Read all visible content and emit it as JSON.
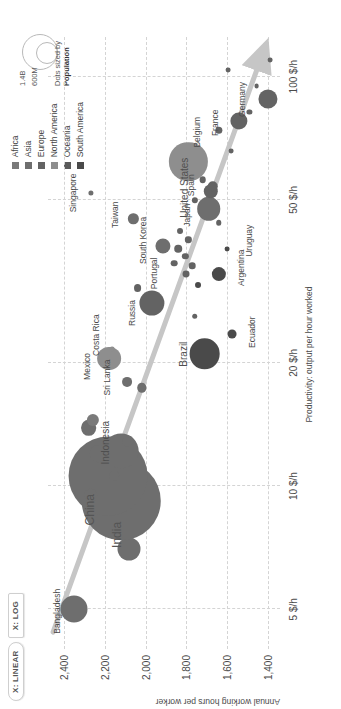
{
  "toolbar": {
    "linear_label": "X: LINEAR",
    "log_label": "X: LOG"
  },
  "legend": {
    "items": [
      {
        "label": "Africa",
        "color": "#7a7a7a"
      },
      {
        "label": "Asia",
        "color": "#6e6e6e"
      },
      {
        "label": "Europe",
        "color": "#636363"
      },
      {
        "label": "North America",
        "color": "#8e8e8e"
      },
      {
        "label": "Oceania",
        "color": "#5a5a5a"
      },
      {
        "label": "South America",
        "color": "#4a4a4a"
      }
    ],
    "size_big": "1.4B",
    "size_small": "600M",
    "size_caption_1": "Dots sized by",
    "size_caption_2": "Population"
  },
  "chart_data": {
    "type": "scatter",
    "title": "",
    "xlabel": "Productivity: output per hour worked",
    "ylabel": "Annual working hours per worker",
    "xscale": "log",
    "xticks": [
      "5 $/h",
      "10 $/h",
      "20 $/h",
      "50 $/h",
      "100 $/h"
    ],
    "xtick_values": [
      5,
      10,
      20,
      50,
      100
    ],
    "yticks": [
      "2,400",
      "2,200",
      "2,000",
      "1,800",
      "1,600",
      "1,400"
    ],
    "ytick_values": [
      2400,
      2200,
      2000,
      1800,
      1600,
      1400
    ],
    "xlim": [
      4.0,
      125
    ],
    "ylim": [
      1340,
      2480
    ],
    "grid": true,
    "legend_position": "top-right",
    "annotation": "Dots sized by Population",
    "trendline": {
      "from_x": 4.4,
      "from_y": 2455,
      "to_x": 112,
      "to_y": 1430
    },
    "points": [
      {
        "name": "Bangladesh",
        "x": 5.0,
        "y": 2350,
        "pop": 165,
        "region": "Asia",
        "label": true,
        "lx": -2,
        "ly": -17
      },
      {
        "name": "",
        "x": 7.0,
        "y": 2080,
        "pop": 120,
        "region": "Asia",
        "label": false
      },
      {
        "name": "India",
        "x": 9.2,
        "y": 2120,
        "pop": 1400,
        "region": "Asia",
        "label": true,
        "lx": -34,
        "ly": -4
      },
      {
        "name": "China",
        "x": 10.6,
        "y": 2185,
        "pop": 1410,
        "region": "Asia",
        "label": true,
        "lx": -34,
        "ly": -18
      },
      {
        "name": "",
        "x": 10.6,
        "y": 2155,
        "pop": 22,
        "region": "Asia",
        "label": false
      },
      {
        "name": "Indonesia",
        "x": 12.2,
        "y": 2120,
        "pop": 275,
        "region": "Asia",
        "label": true,
        "lx": 8,
        "ly": -16
      },
      {
        "name": "",
        "x": 12.0,
        "y": 2235,
        "pop": 60,
        "region": "Asia",
        "label": false
      },
      {
        "name": "",
        "x": 9.5,
        "y": 2270,
        "pop": 42,
        "region": "Asia",
        "label": false
      },
      {
        "name": "",
        "x": 12.9,
        "y": 2085,
        "pop": 28,
        "region": "Asia",
        "label": false
      },
      {
        "name": "",
        "x": 13.9,
        "y": 2280,
        "pop": 56,
        "region": "Asia",
        "label": false
      },
      {
        "name": "",
        "x": 14.5,
        "y": 2260,
        "pop": 34,
        "region": "Africa",
        "label": false
      },
      {
        "name": "Sri Lanka",
        "x": 18.0,
        "y": 2090,
        "pop": 22,
        "region": "Asia",
        "label": true,
        "lx": 4,
        "ly": -20
      },
      {
        "name": "",
        "x": 17.4,
        "y": 2020,
        "pop": 20,
        "region": "Asia",
        "label": false
      },
      {
        "name": "Mexico",
        "x": 20.5,
        "y": 2180,
        "pop": 128,
        "region": "North America",
        "label": true,
        "lx": -8,
        "ly": -22
      },
      {
        "name": "Costa Rica",
        "x": 21.6,
        "y": 2165,
        "pop": 5,
        "region": "North America",
        "label": true,
        "lx": 14,
        "ly": -16
      },
      {
        "name": "Brazil",
        "x": 21.0,
        "y": 1710,
        "pop": 214,
        "region": "South America",
        "label": true,
        "lx": 0,
        "ly": -22
      },
      {
        "name": "Ecuador",
        "x": 23.5,
        "y": 1575,
        "pop": 18,
        "region": "South America",
        "label": true,
        "lx": 2,
        "ly": 20
      },
      {
        "name": "Russia",
        "x": 28.0,
        "y": 1970,
        "pop": 144,
        "region": "Europe",
        "label": true,
        "lx": -10,
        "ly": -20
      },
      {
        "name": "",
        "x": 30.5,
        "y": 2040,
        "pop": 14,
        "region": "Europe",
        "label": false
      },
      {
        "name": "South Korea",
        "x": 38.5,
        "y": 1915,
        "pop": 52,
        "region": "Asia",
        "label": true,
        "lx": 6,
        "ly": -20
      },
      {
        "name": "Taiwan",
        "x": 45.0,
        "y": 2060,
        "pop": 24,
        "region": "Asia",
        "label": true,
        "lx": 4,
        "ly": -18
      },
      {
        "name": "Singapore",
        "x": 52.0,
        "y": 2270,
        "pop": 6,
        "region": "Asia",
        "label": true,
        "lx": 0,
        "ly": -18
      },
      {
        "name": "Portugal",
        "x": 35.0,
        "y": 1860,
        "pop": 10,
        "region": "Europe",
        "label": true,
        "lx": -10,
        "ly": -20
      },
      {
        "name": "",
        "x": 33.0,
        "y": 1800,
        "pop": 11,
        "region": "Europe",
        "label": false
      },
      {
        "name": "",
        "x": 34.5,
        "y": 1770,
        "pop": 10,
        "region": "Europe",
        "label": false
      },
      {
        "name": "",
        "x": 36.5,
        "y": 1805,
        "pop": 9,
        "region": "Europe",
        "label": false
      },
      {
        "name": "",
        "x": 38.0,
        "y": 1840,
        "pop": 13,
        "region": "Europe",
        "label": false
      },
      {
        "name": "",
        "x": 40.0,
        "y": 1790,
        "pop": 9,
        "region": "Europe",
        "label": false
      },
      {
        "name": "",
        "x": 42.0,
        "y": 1830,
        "pop": 8,
        "region": "Europe",
        "label": false
      },
      {
        "name": "",
        "x": 31.0,
        "y": 1745,
        "pop": 8,
        "region": "South America",
        "label": false
      },
      {
        "name": "Argentina",
        "x": 33.0,
        "y": 1640,
        "pop": 46,
        "region": "South America",
        "label": true,
        "lx": 6,
        "ly": 22
      },
      {
        "name": "Uruguay",
        "x": 38.0,
        "y": 1600,
        "pop": 3,
        "region": "South America",
        "label": true,
        "lx": 8,
        "ly": 22
      },
      {
        "name": "",
        "x": 44.0,
        "y": 1640,
        "pop": 7,
        "region": "Europe",
        "label": false
      },
      {
        "name": "United States",
        "x": 62.0,
        "y": 1790,
        "pop": 332,
        "region": "North America",
        "label": true,
        "lx": -26,
        "ly": -4
      },
      {
        "name": "Japan",
        "x": 47.5,
        "y": 1690,
        "pop": 126,
        "region": "Asia",
        "label": true,
        "lx": -6,
        "ly": -22
      },
      {
        "name": "Spain",
        "x": 52.5,
        "y": 1680,
        "pop": 47,
        "region": "Europe",
        "label": true,
        "lx": 6,
        "ly": -20
      },
      {
        "name": "",
        "x": 54.0,
        "y": 1670,
        "pop": 25,
        "region": "Europe",
        "label": false
      },
      {
        "name": "",
        "x": 56.0,
        "y": 1720,
        "pop": 10,
        "region": "Europe",
        "label": false
      },
      {
        "name": "",
        "x": 50.0,
        "y": 1760,
        "pop": 9,
        "region": "Europe",
        "label": false
      },
      {
        "name": "Belgium",
        "x": 74.0,
        "y": 1640,
        "pop": 12,
        "region": "Europe",
        "label": true,
        "lx": -2,
        "ly": -22
      },
      {
        "name": "France",
        "x": 78.0,
        "y": 1540,
        "pop": 67,
        "region": "Europe",
        "label": true,
        "lx": -2,
        "ly": -24
      },
      {
        "name": "Germany",
        "x": 88.0,
        "y": 1400,
        "pop": 83,
        "region": "Europe",
        "label": true,
        "lx": 0,
        "ly": -26
      },
      {
        "name": "",
        "x": 82.0,
        "y": 1490,
        "pop": 6,
        "region": "Europe",
        "label": false
      },
      {
        "name": "",
        "x": 95.0,
        "y": 1455,
        "pop": 5,
        "region": "Europe",
        "label": false
      },
      {
        "name": "",
        "x": 104.0,
        "y": 1595,
        "pop": 5,
        "region": "Europe",
        "label": false
      },
      {
        "name": "",
        "x": 110.0,
        "y": 1388,
        "pop": 5,
        "region": "Europe",
        "label": false
      },
      {
        "name": "",
        "x": 66.0,
        "y": 1580,
        "pop": 5,
        "region": "Europe",
        "label": false
      },
      {
        "name": "",
        "x": 26.0,
        "y": 1760,
        "pop": 7,
        "region": "Europe",
        "label": false
      }
    ]
  }
}
